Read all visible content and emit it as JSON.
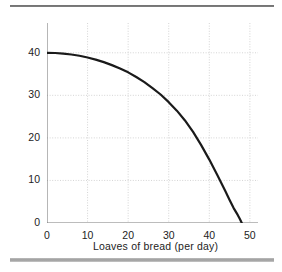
{
  "figure": {
    "top_rule": "horizontal-rule",
    "bottom_rule": "horizontal-rule"
  },
  "chart_data": {
    "type": "line",
    "title": "",
    "xlabel": "Loaves of bread (per day)",
    "ylabel": "Pizza (per day)",
    "xlim": [
      0,
      52
    ],
    "ylim": [
      0,
      47
    ],
    "xticks": [
      0,
      10,
      20,
      30,
      40,
      50
    ],
    "yticks": [
      0,
      10,
      20,
      30,
      40
    ],
    "xticklabels": [
      "0",
      "10",
      "20",
      "30",
      "40",
      "50"
    ],
    "yticklabels": [
      "0",
      "10",
      "20",
      "30",
      "40"
    ],
    "grid": true,
    "grid_style": "dotted",
    "grid_color": "#c9c9c9",
    "legend": null,
    "series": [
      {
        "name": "production-possibilities-frontier",
        "color": "#1a1a1a",
        "linewidth": 2.2,
        "x": [
          0,
          2,
          4,
          6,
          8,
          10,
          12,
          14,
          16,
          18,
          20,
          22,
          24,
          26,
          28,
          30,
          32,
          34,
          36,
          38,
          40,
          42,
          44,
          45,
          46,
          47,
          47.5,
          48
        ],
        "y": [
          40.0,
          39.95,
          39.8,
          39.6,
          39.3,
          38.9,
          38.4,
          37.8,
          37.1,
          36.3,
          35.4,
          34.3,
          33.1,
          31.7,
          30.2,
          28.4,
          26.4,
          24.1,
          21.4,
          18.3,
          14.9,
          11.2,
          7.4,
          5.4,
          3.5,
          1.9,
          1.0,
          0.0
        ]
      }
    ],
    "annotations": []
  }
}
